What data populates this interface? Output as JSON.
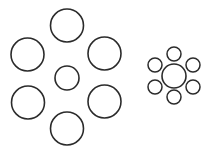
{
  "figure": {
    "canvas": {
      "width": 212,
      "height": 154,
      "background": "#ffffff"
    },
    "stroke_color": "#2b2b2b",
    "fill_color": "none",
    "stroke_width": 1.6
  },
  "chart_data": {
    "type": "scatter",
    "xlabel": "",
    "ylabel": "",
    "xlim": [
      0,
      212
    ],
    "ylim": [
      0,
      154
    ],
    "grid": false,
    "legend": "none",
    "annotations": [],
    "series": [
      {
        "name": "left-group-surrounding-large-circles",
        "marker": "open-circle",
        "count": 6,
        "diameter": 33,
        "x": [
          67,
          27.5,
          104.5,
          28,
          104.5,
          67
        ],
        "y": [
          25.5,
          54.5,
          53.5,
          102.5,
          101.5,
          128.5
        ],
        "sizes": [
          33,
          33,
          33,
          33,
          33,
          33
        ]
      },
      {
        "name": "left-group-center-circle",
        "marker": "open-circle",
        "count": 1,
        "diameter": 24,
        "x": [
          67
        ],
        "y": [
          78
        ],
        "sizes": [
          24
        ]
      },
      {
        "name": "right-group-surrounding-small-circles",
        "marker": "open-circle",
        "count": 6,
        "diameter": 14,
        "x": [
          174,
          155,
          193,
          155,
          193,
          174
        ],
        "y": [
          54,
          65,
          65,
          87,
          87,
          97
        ],
        "sizes": [
          14,
          14,
          14,
          14,
          14,
          14
        ]
      },
      {
        "name": "right-group-center-circle",
        "marker": "open-circle",
        "count": 1,
        "diameter": 24,
        "x": [
          174
        ],
        "y": [
          76
        ],
        "sizes": [
          24
        ]
      }
    ]
  },
  "groups": {
    "left": {
      "name": "left-cluster",
      "center_circle": {
        "cx": 67,
        "cy": 78,
        "r": 12
      },
      "surrounding_circles": [
        {
          "cx": 67,
          "cy": 25.5,
          "r": 16.5
        },
        {
          "cx": 27.5,
          "cy": 54.5,
          "r": 16.5
        },
        {
          "cx": 104.5,
          "cy": 53.5,
          "r": 16.5
        },
        {
          "cx": 28,
          "cy": 102.5,
          "r": 16.5
        },
        {
          "cx": 104.5,
          "cy": 101.5,
          "r": 16.5
        },
        {
          "cx": 67,
          "cy": 128.5,
          "r": 16.5
        }
      ]
    },
    "right": {
      "name": "right-cluster",
      "center_circle": {
        "cx": 174,
        "cy": 76,
        "r": 12
      },
      "surrounding_circles": [
        {
          "cx": 174,
          "cy": 54,
          "r": 7
        },
        {
          "cx": 155,
          "cy": 65,
          "r": 7
        },
        {
          "cx": 193,
          "cy": 65,
          "r": 7
        },
        {
          "cx": 155,
          "cy": 87,
          "r": 7
        },
        {
          "cx": 193,
          "cy": 87,
          "r": 7
        },
        {
          "cx": 174,
          "cy": 97,
          "r": 7
        }
      ]
    }
  }
}
